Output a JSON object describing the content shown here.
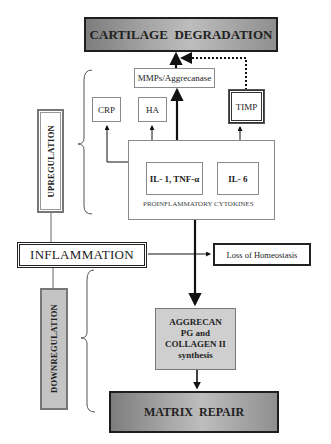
{
  "diagram": {
    "top_outcome": "CARTILAGE  DEGRADATION",
    "bottom_outcome": "MATRIX  REPAIR",
    "center": "INFLAMMATION",
    "side_outcome": "Loss of Homeostasis",
    "upregulation_label": "UPREGULATION",
    "downregulation_label": "DOWNREGULATION",
    "mediators": {
      "mmps": "MMPs/Aggrecanase",
      "crp": "CRP",
      "ha": "HA",
      "timp": "TIMP"
    },
    "cytokines": {
      "il1_tnf": "IL- 1, TNF-α",
      "il6": "IL- 6",
      "group_label": "PROINFLAMMATORY CYTOKINES"
    },
    "synthesis": {
      "line1": "AGGRECAN",
      "line2": "PG and",
      "line3": "COLLAGEN II",
      "line4": "synthesis"
    },
    "colors": {
      "outcome_fill": "#a8a8a8",
      "downregulation_fill": "#c4c4c4",
      "synthesis_fill": "#cfcfcf",
      "line": "#111111"
    }
  }
}
